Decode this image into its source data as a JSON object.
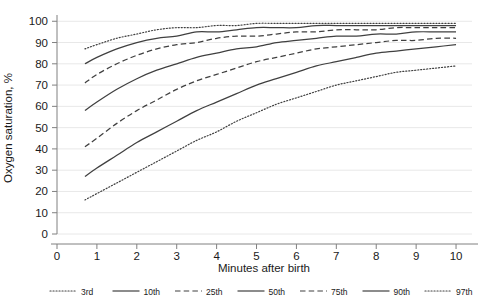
{
  "chart_data": {
    "type": "line",
    "title": "",
    "xlabel": "Minutes after birth",
    "ylabel": "Oxygen saturation, %",
    "xlim": [
      0,
      10.4
    ],
    "ylim": [
      0,
      102
    ],
    "xticks": [
      0,
      1,
      2,
      3,
      4,
      5,
      6,
      7,
      8,
      9,
      10
    ],
    "yticks": [
      0,
      10,
      20,
      30,
      40,
      50,
      60,
      70,
      80,
      90,
      100
    ],
    "grid": "horizontal",
    "legend_position": "bottom",
    "x": [
      0.7,
      1,
      1.5,
      2,
      2.5,
      3,
      3.5,
      4,
      4.5,
      5,
      5.5,
      6,
      6.5,
      7,
      7.5,
      8,
      8.5,
      9,
      9.5,
      10
    ],
    "series": [
      {
        "name": "3rd",
        "style": "dotted",
        "values": [
          16,
          19,
          24,
          29,
          34,
          39,
          44,
          48,
          53,
          57,
          61,
          64,
          67,
          70,
          72,
          74,
          76,
          77,
          78,
          79
        ]
      },
      {
        "name": "10th",
        "style": "solid",
        "values": [
          27,
          31,
          37,
          43,
          48,
          53,
          58,
          62,
          66,
          70,
          73,
          76,
          79,
          81,
          83,
          85,
          86,
          87,
          88,
          89
        ]
      },
      {
        "name": "25th",
        "style": "dashed",
        "values": [
          41,
          45,
          52,
          58,
          63,
          68,
          72,
          75,
          78,
          81,
          83,
          85,
          87,
          88,
          89,
          90,
          91,
          91,
          92,
          92
        ]
      },
      {
        "name": "50th",
        "style": "solid",
        "values": [
          58,
          62,
          68,
          73,
          77,
          80,
          83,
          85,
          87,
          88,
          90,
          91,
          92,
          93,
          93,
          94,
          94,
          95,
          95,
          95
        ]
      },
      {
        "name": "75th",
        "style": "dashed",
        "values": [
          71,
          75,
          80,
          84,
          87,
          89,
          90,
          92,
          93,
          93,
          94,
          95,
          95,
          96,
          96,
          96,
          97,
          97,
          97,
          97
        ]
      },
      {
        "name": "90th",
        "style": "solid",
        "values": [
          80,
          83,
          87,
          90,
          92,
          93,
          95,
          95,
          96,
          97,
          97,
          97,
          98,
          98,
          98,
          98,
          98,
          98,
          98,
          98
        ]
      },
      {
        "name": "97th",
        "style": "dotted",
        "values": [
          87,
          89,
          92,
          94,
          96,
          97,
          97,
          98,
          98,
          99,
          99,
          99,
          99,
          99,
          99,
          99,
          99,
          99,
          99,
          99
        ]
      }
    ]
  },
  "axes": {
    "y_title": "Oxygen saturation, %",
    "x_title": "Minutes after birth",
    "y_tick_labels": [
      "0",
      "10",
      "20",
      "30",
      "40",
      "50",
      "60",
      "70",
      "80",
      "90",
      "100"
    ],
    "x_tick_labels": [
      "0",
      "1",
      "2",
      "3",
      "4",
      "5",
      "6",
      "7",
      "8",
      "9",
      "10"
    ]
  },
  "legend": {
    "items": [
      {
        "label": "3rd",
        "style": "dotted"
      },
      {
        "label": "10th",
        "style": "solid"
      },
      {
        "label": "25th",
        "style": "dashed"
      },
      {
        "label": "50th",
        "style": "solid"
      },
      {
        "label": "75th",
        "style": "dashed"
      },
      {
        "label": "90th",
        "style": "solid"
      },
      {
        "label": "97th",
        "style": "dotted"
      }
    ]
  },
  "colors": {
    "line": "#404040",
    "axis": "#808080",
    "grid": "#e8e8e8",
    "text": "#1a1a1a",
    "background": "#ffffff"
  }
}
